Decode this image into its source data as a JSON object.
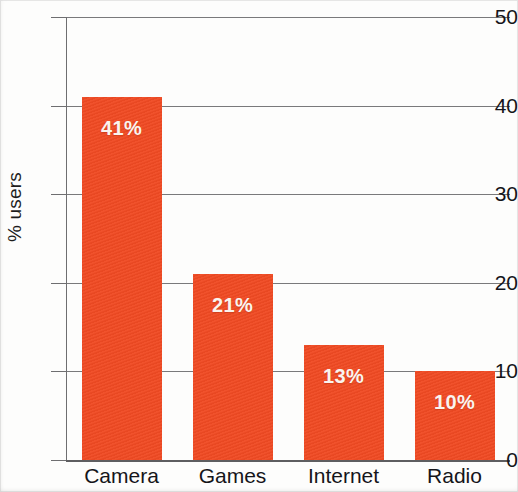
{
  "chart_data": {
    "type": "bar",
    "title": "",
    "xlabel": "",
    "ylabel": "% users",
    "categories": [
      "Camera",
      "Games",
      "Internet",
      "Radio"
    ],
    "values": [
      41,
      21,
      13,
      10
    ],
    "data_labels": [
      "41%",
      "21%",
      "13%",
      "10%"
    ],
    "ylim": [
      0,
      50
    ],
    "ytick_labels": [
      "50",
      "40",
      "30",
      "20",
      "10",
      "0"
    ],
    "ytick_values": [
      50,
      40,
      30,
      20,
      10,
      0
    ],
    "grid": "horizontal",
    "legend": "none",
    "bar_color": "#f04a23",
    "label_color": "#faf4ef",
    "axis_color": "#6e6e70"
  }
}
